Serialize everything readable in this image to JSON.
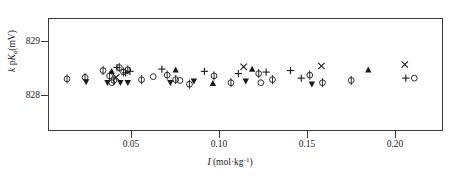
{
  "chart_data": {
    "type": "scatter",
    "title": "",
    "xlabel": "I (mol·kg-1)",
    "ylabel": "k pKa(mV)",
    "xlim": [
      0.0,
      0.2236
    ],
    "ylim": [
      827.73,
      829.22
    ],
    "xticks": [
      0.05,
      0.1,
      0.15,
      0.2
    ],
    "xtick_labels": [
      "0.05",
      "0.10",
      "0.15",
      "0.20"
    ],
    "yticks": [
      828,
      829
    ],
    "ytick_labels": [
      "828",
      "829"
    ],
    "grid": false,
    "legend": false,
    "marker_kinds": [
      "phi",
      "plus",
      "triangle-up",
      "triangle-down",
      "cross",
      "circle"
    ],
    "series": [
      {
        "name": "phi",
        "marker": "phi",
        "points": [
          {
            "x": 0.0102,
            "y": 828.43
          },
          {
            "x": 0.0204,
            "y": 828.45
          },
          {
            "x": 0.0306,
            "y": 828.54
          },
          {
            "x": 0.0343,
            "y": 828.47
          },
          {
            "x": 0.0367,
            "y": 828.41
          },
          {
            "x": 0.0398,
            "y": 828.58
          },
          {
            "x": 0.0422,
            "y": 828.52
          },
          {
            "x": 0.0446,
            "y": 828.55
          },
          {
            "x": 0.0524,
            "y": 828.42
          },
          {
            "x": 0.0669,
            "y": 828.48
          },
          {
            "x": 0.0717,
            "y": 828.42
          },
          {
            "x": 0.0795,
            "y": 828.36
          },
          {
            "x": 0.0934,
            "y": 828.47
          },
          {
            "x": 0.103,
            "y": 828.38
          },
          {
            "x": 0.1187,
            "y": 828.5
          },
          {
            "x": 0.1265,
            "y": 828.42
          },
          {
            "x": 0.1476,
            "y": 828.48
          },
          {
            "x": 0.1548,
            "y": 828.38
          },
          {
            "x": 0.1711,
            "y": 828.41
          }
        ]
      },
      {
        "name": "plus",
        "marker": "plus",
        "points": [
          {
            "x": 0.0385,
            "y": 828.58
          },
          {
            "x": 0.0434,
            "y": 828.51
          },
          {
            "x": 0.0458,
            "y": 828.53
          },
          {
            "x": 0.0639,
            "y": 828.56
          },
          {
            "x": 0.088,
            "y": 828.53
          },
          {
            "x": 0.1072,
            "y": 828.5
          },
          {
            "x": 0.1229,
            "y": 828.52
          },
          {
            "x": 0.1367,
            "y": 828.54
          },
          {
            "x": 0.1428,
            "y": 828.44
          },
          {
            "x": 0.202,
            "y": 828.44
          }
        ]
      },
      {
        "name": "triangle-up",
        "marker": "triangle-up",
        "points": [
          {
            "x": 0.0355,
            "y": 828.53
          },
          {
            "x": 0.0717,
            "y": 828.55
          },
          {
            "x": 0.0928,
            "y": 828.37
          },
          {
            "x": 0.115,
            "y": 828.56
          },
          {
            "x": 0.1807,
            "y": 828.55
          }
        ]
      },
      {
        "name": "triangle-down",
        "marker": "triangle-down",
        "points": [
          {
            "x": 0.021,
            "y": 828.39
          },
          {
            "x": 0.0331,
            "y": 828.38
          },
          {
            "x": 0.0404,
            "y": 828.38
          },
          {
            "x": 0.0446,
            "y": 828.38
          },
          {
            "x": 0.0687,
            "y": 828.38
          },
          {
            "x": 0.082,
            "y": 828.4
          },
          {
            "x": 0.1114,
            "y": 828.4
          },
          {
            "x": 0.1488,
            "y": 828.36
          }
        ]
      },
      {
        "name": "cross",
        "marker": "cross",
        "points": [
          {
            "x": 0.038,
            "y": 828.45
          },
          {
            "x": 0.1102,
            "y": 828.59
          },
          {
            "x": 0.1542,
            "y": 828.6
          },
          {
            "x": 0.2014,
            "y": 828.62
          }
        ]
      },
      {
        "name": "circle",
        "marker": "circle",
        "points": [
          {
            "x": 0.0356,
            "y": 828.38
          },
          {
            "x": 0.059,
            "y": 828.46
          },
          {
            "x": 0.0741,
            "y": 828.41
          },
          {
            "x": 0.1199,
            "y": 828.38
          },
          {
            "x": 0.2068,
            "y": 828.44
          }
        ]
      }
    ]
  }
}
